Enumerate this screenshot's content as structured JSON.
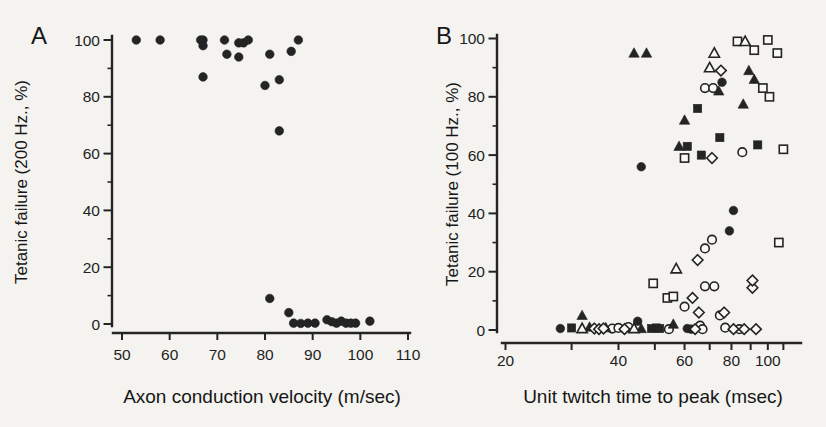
{
  "figure": {
    "background": "#f4f3f0",
    "ink": "#242424",
    "paper": "#faf9f6"
  },
  "chart_data": [
    {
      "panel": "A",
      "type": "scatter",
      "xlabel": "Axon conduction velocity (m/sec)",
      "ylabel": "Tetanic failure (200 Hz., %)",
      "xscale": "linear",
      "xlim": [
        50,
        110
      ],
      "ylim": [
        0,
        100
      ],
      "xticks": [
        50,
        60,
        70,
        80,
        90,
        100,
        110
      ],
      "xtick_labels": [
        "50",
        "60",
        "70",
        "80",
        "90",
        "100",
        "110"
      ],
      "yticks": [
        0,
        20,
        40,
        60,
        80,
        100
      ],
      "ytick_labels": [
        "0",
        "20",
        "40",
        "60",
        "80",
        "100"
      ],
      "yminor": [
        10,
        30,
        50,
        70,
        90
      ],
      "grid": false,
      "legend": "none",
      "series": [
        {
          "name": "motor-units",
          "marker": "filled-circle",
          "points": [
            [
              53,
              100
            ],
            [
              58,
              100
            ],
            [
              66.5,
              100
            ],
            [
              67,
              100
            ],
            [
              67,
              98
            ],
            [
              67,
              87
            ],
            [
              71.5,
              100
            ],
            [
              72,
              95
            ],
            [
              74.5,
              94
            ],
            [
              74.5,
              99
            ],
            [
              75.5,
              99
            ],
            [
              76.5,
              100
            ],
            [
              81,
              95
            ],
            [
              85.5,
              96
            ],
            [
              87,
              100
            ],
            [
              80,
              84
            ],
            [
              83,
              86
            ],
            [
              83,
              68
            ],
            [
              81,
              9
            ],
            [
              85,
              4
            ],
            [
              86,
              0.3
            ],
            [
              87.5,
              0.2
            ],
            [
              89,
              0.3
            ],
            [
              90.5,
              0.3
            ],
            [
              93,
              1.5
            ],
            [
              94,
              0.8
            ],
            [
              95,
              0.3
            ],
            [
              96,
              1
            ],
            [
              97,
              0.3
            ],
            [
              98,
              0.3
            ],
            [
              99,
              0.3
            ],
            [
              102,
              1
            ]
          ]
        }
      ]
    },
    {
      "panel": "B",
      "type": "scatter",
      "xlabel": "Unit twitch time to peak (msec)",
      "ylabel": "Tetanic failure (100 Hz., %)",
      "xscale": "log",
      "xlim": [
        20,
        110
      ],
      "ylim": [
        0,
        100
      ],
      "xticks": [
        20,
        30,
        40,
        50,
        60,
        70,
        80,
        90,
        100,
        110
      ],
      "xtick_labels": [
        "20",
        "",
        "40",
        "",
        "60",
        "",
        "80",
        "",
        "100",
        ""
      ],
      "yticks": [
        0,
        20,
        40,
        60,
        80,
        100
      ],
      "ytick_labels": [
        "0",
        "20",
        "40",
        "60",
        "80",
        "100"
      ],
      "yminor": [
        10,
        30,
        50,
        70,
        90
      ],
      "grid": false,
      "legend": "none",
      "series": [
        {
          "name": "units-filled-circle",
          "marker": "filled-circle",
          "points": [
            [
              28,
              0.5
            ],
            [
              45,
              3
            ],
            [
              46,
              56
            ],
            [
              61,
              0.5
            ],
            [
              62.5,
              0.3
            ],
            [
              75.5,
              85
            ],
            [
              79,
              34
            ],
            [
              81,
              41
            ]
          ]
        },
        {
          "name": "units-open-circle",
          "marker": "open-circle",
          "points": [
            [
              38.5,
              0.5
            ],
            [
              40,
              0.7
            ],
            [
              42.5,
              1
            ],
            [
              54.5,
              0.3
            ],
            [
              60,
              8
            ],
            [
              66,
              1.5
            ],
            [
              67,
              0.3
            ],
            [
              68,
              15
            ],
            [
              68,
              28
            ],
            [
              71,
              31
            ],
            [
              72,
              15
            ],
            [
              74.5,
              5
            ],
            [
              77,
              0.8
            ],
            [
              84,
              0.3
            ],
            [
              85.5,
              61
            ],
            [
              68,
              83
            ],
            [
              71.5,
              83
            ]
          ]
        },
        {
          "name": "units-filled-square",
          "marker": "filled-square",
          "points": [
            [
              30,
              0.7
            ],
            [
              49,
              0.5
            ],
            [
              50.5,
              0.7
            ],
            [
              51.5,
              0.5
            ],
            [
              61,
              63
            ],
            [
              65,
              76
            ],
            [
              66.5,
              60
            ],
            [
              74.5,
              66
            ],
            [
              94,
              63.5
            ]
          ]
        },
        {
          "name": "units-open-square",
          "marker": "open-square",
          "points": [
            [
              49.5,
              16
            ],
            [
              54,
              11
            ],
            [
              56,
              11.5
            ],
            [
              60,
              59
            ],
            [
              83,
              99
            ],
            [
              92,
              96
            ],
            [
              97,
              83
            ],
            [
              100,
              99.5
            ],
            [
              101,
              80
            ],
            [
              106,
              95
            ],
            [
              107,
              30
            ],
            [
              110,
              62
            ]
          ]
        },
        {
          "name": "units-filled-triangle",
          "marker": "filled-triangle",
          "points": [
            [
              32,
              5
            ],
            [
              33.5,
              1
            ],
            [
              37,
              0.8
            ],
            [
              44,
              95
            ],
            [
              46,
              0.5
            ],
            [
              47.5,
              95
            ],
            [
              56,
              2
            ],
            [
              58,
              63
            ],
            [
              60,
              72
            ],
            [
              74,
              82
            ],
            [
              86,
              77.5
            ],
            [
              89,
              89
            ],
            [
              92,
              86
            ]
          ]
        },
        {
          "name": "units-open-triangle",
          "marker": "open-triangle",
          "points": [
            [
              32,
              0.5
            ],
            [
              44,
              0.5
            ],
            [
              57,
              21
            ],
            [
              70,
              90
            ],
            [
              72,
              95
            ],
            [
              87,
              99
            ]
          ]
        },
        {
          "name": "units-open-diamond",
          "marker": "open-diamond",
          "points": [
            [
              34.5,
              0.5
            ],
            [
              35.5,
              0.3
            ],
            [
              36.5,
              0.5
            ],
            [
              41.5,
              0.3
            ],
            [
              63,
              11
            ],
            [
              64,
              0.3
            ],
            [
              65,
              24
            ],
            [
              65.5,
              6
            ],
            [
              71,
              59
            ],
            [
              75,
              89
            ],
            [
              76.5,
              6
            ],
            [
              81,
              0.3
            ],
            [
              86.5,
              0.3
            ],
            [
              91,
              14.5
            ],
            [
              91,
              17
            ],
            [
              93,
              0.3
            ]
          ]
        }
      ]
    }
  ]
}
